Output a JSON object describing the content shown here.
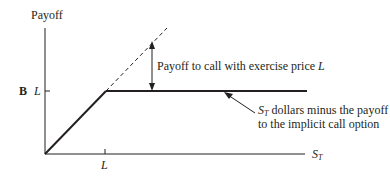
{
  "diagram": {
    "y_axis_label": "Payoff",
    "x_axis_label": "S",
    "x_axis_label_sub": "T",
    "panel_label": "B",
    "y_tick_label": "L",
    "x_tick_label": "L",
    "annotation_call": {
      "text": "Payoff to call with exercise price ",
      "italic_suffix": "L"
    },
    "annotation_flat": {
      "line1_var": "S",
      "line1_var_sub": "T",
      "line1_text": " dollars minus the payoff",
      "line2_text": "to the implicit call option"
    },
    "colors": {
      "ink": "#231f20",
      "background": "#ffffff"
    }
  }
}
